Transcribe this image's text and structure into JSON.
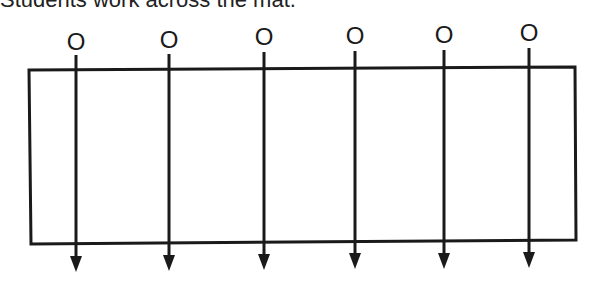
{
  "caption": "Students work across the mat.",
  "diagram": {
    "type": "mat-movement",
    "mat": {
      "shape": "rectangle",
      "corners": [
        [
          29,
          70
        ],
        [
          575,
          67
        ],
        [
          576,
          240
        ],
        [
          31,
          244
        ]
      ]
    },
    "students": [
      {
        "label": "O",
        "x": 76,
        "label_y": 50,
        "line_top": 55,
        "arrow_tip": 272
      },
      {
        "label": "O",
        "x": 169,
        "label_y": 48,
        "line_top": 54,
        "arrow_tip": 271
      },
      {
        "label": "O",
        "x": 264,
        "label_y": 45,
        "line_top": 52,
        "arrow_tip": 270
      },
      {
        "label": "O",
        "x": 355,
        "label_y": 44,
        "line_top": 51,
        "arrow_tip": 269
      },
      {
        "label": "O",
        "x": 444,
        "label_y": 43,
        "line_top": 50,
        "arrow_tip": 269
      },
      {
        "label": "O",
        "x": 529,
        "label_y": 41,
        "line_top": 48,
        "arrow_tip": 268
      }
    ],
    "direction": "down",
    "stroke_color": "#1a1a1a"
  }
}
